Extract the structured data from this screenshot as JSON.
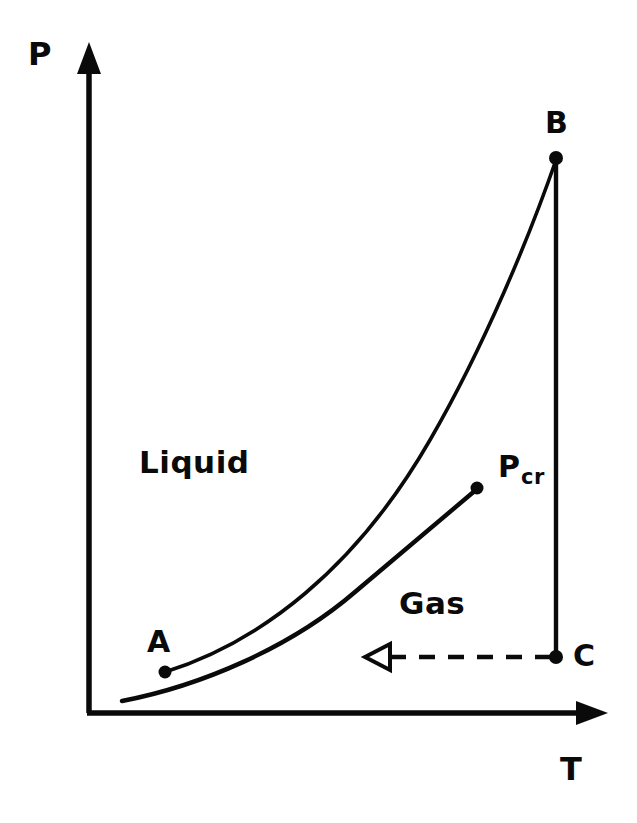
{
  "figure": {
    "type": "phase-diagram",
    "background_color": "#ffffff",
    "ink_color": "#0a0a0a"
  },
  "axes": {
    "y_label": "P",
    "x_label": "T",
    "origin": {
      "x": 89,
      "y": 713
    },
    "y_axis_tip": {
      "x": 89,
      "y": 45
    },
    "x_axis_tip": {
      "x": 607,
      "y": 713
    },
    "arrowheads": "filled-triangle"
  },
  "regions": [
    {
      "id": "liquid",
      "label": "Liquid",
      "x": 139,
      "y": 447
    },
    {
      "id": "gas",
      "label": "Gas",
      "x": 399,
      "y": 588
    }
  ],
  "points": [
    {
      "id": "A",
      "label": "A",
      "dot_x": 165,
      "dot_y": 672,
      "label_x": 147,
      "label_y": 627
    },
    {
      "id": "B",
      "label": "B",
      "dot_x": 556,
      "dot_y": 158,
      "label_x": 545,
      "label_y": 108
    },
    {
      "id": "C",
      "label": "C",
      "dot_x": 556,
      "dot_y": 657,
      "label_x": 573,
      "label_y": 641
    },
    {
      "id": "Pcr",
      "label": "P",
      "sublabel": "cr",
      "dot_x": 477,
      "dot_y": 487,
      "label_x": 498,
      "label_y": 452
    }
  ],
  "curves": [
    {
      "id": "upper-curve",
      "name": "liquid-gas-boundary-upper",
      "from_point": "A",
      "to_point": "B",
      "stroke_width": 3.4,
      "path": "M 165 672 C 260 642, 355 570, 430 440 C 485 345, 530 235, 556 160"
    },
    {
      "id": "lower-curve",
      "name": "saturation-curve-lower",
      "from_point": "origin-region",
      "to_point": "Pcr",
      "stroke_width": 4.2,
      "path": "M 122 701 C 200 686, 290 648, 355 592 C 410 546, 450 512, 477 489"
    }
  ],
  "lines": [
    {
      "id": "isotherm-bc",
      "name": "vertical-line-B-to-C",
      "x1": 556,
      "y1": 158,
      "x2": 556,
      "y2": 657,
      "stroke_width": 4.2,
      "style": "solid"
    }
  ],
  "arrows": [
    {
      "id": "process-arrow",
      "name": "dashed-process-arrow",
      "from": {
        "x": 553,
        "y": 657
      },
      "to": {
        "x": 366,
        "y": 657
      },
      "style": "dashed",
      "dash_pattern": "16 12",
      "stroke_width": 4.5,
      "head": "open-triangle",
      "direction": "leftward"
    }
  ]
}
